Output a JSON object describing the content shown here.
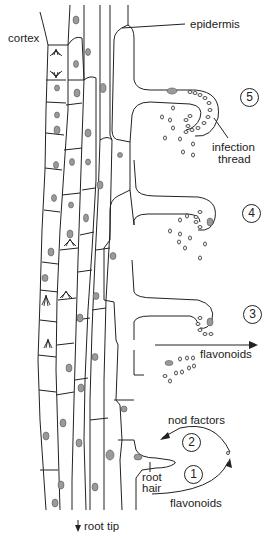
{
  "diagram": {
    "type": "biology-illustration",
    "labels": {
      "epidermis": "epidermis",
      "cortex": "cortex",
      "infection_thread": "infection\nthread",
      "infection_line1": "infection",
      "infection_line2": "thread",
      "flavonoids_upper": "flavonoids",
      "nod_factors": "nod factors",
      "root_hair_line1": "root",
      "root_hair_line2": "hair",
      "flavonoids_lower": "flavonoids",
      "root_tip": "root tip"
    },
    "steps": [
      {
        "number": "5",
        "description": "infection thread grows into root hair"
      },
      {
        "number": "4",
        "description": "bacteria trapped in curled root hair"
      },
      {
        "number": "3",
        "description": "root hair curls around bacteria"
      },
      {
        "number": "2",
        "description": "bacteria release nod factors"
      },
      {
        "number": "1",
        "description": "root releases flavonoids"
      }
    ],
    "step_symbols": {
      "s1": "1",
      "s2": "2",
      "s3": "3",
      "s4": "4",
      "s5": "5"
    },
    "arrow_glyph": "↓",
    "colors": {
      "line": "#222222",
      "nucleus": "#9a9a9a",
      "background": "#ffffff"
    }
  }
}
